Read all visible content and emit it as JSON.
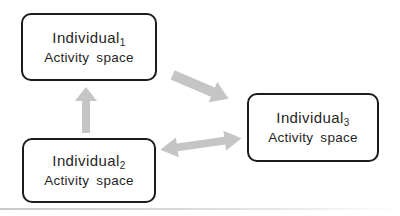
{
  "diagram": {
    "nodes": [
      {
        "id": "individual-1",
        "title": "Individual",
        "subscript": "1",
        "subtitle": "Activity space"
      },
      {
        "id": "individual-2",
        "title": "Individual",
        "subscript": "2",
        "subtitle": "Activity space"
      },
      {
        "id": "individual-3",
        "title": "Individual",
        "subscript": "3",
        "subtitle": "Activity space"
      }
    ],
    "arrows": [
      {
        "id": "arrow-2-to-1",
        "from": "individual-2",
        "to": "individual-1",
        "direction": "up",
        "double_headed": false
      },
      {
        "id": "arrow-1-to-3",
        "from": "individual-1",
        "to": "individual-3",
        "direction": "down-right",
        "double_headed": false
      },
      {
        "id": "arrow-2-and-3",
        "from": "individual-2",
        "to": "individual-3",
        "direction": "bidirectional",
        "double_headed": true
      }
    ],
    "colors": {
      "arrow_fill": "#c5c5c5",
      "box_border": "#1c1c1c",
      "text": "#1f1f1f",
      "background": "#ffffff",
      "scan_line": "#c9c9c9"
    }
  }
}
